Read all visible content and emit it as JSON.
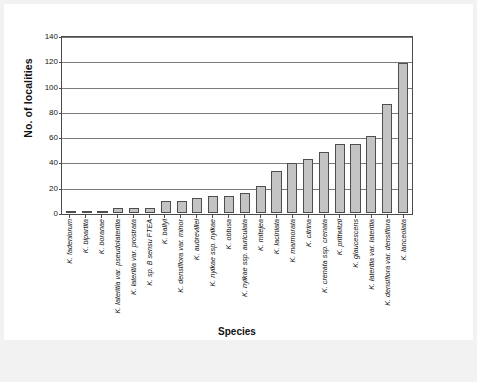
{
  "chart_data": {
    "type": "bar",
    "title": "",
    "xlabel": "Species",
    "ylabel": "No. of localities",
    "ylim": [
      0,
      140
    ],
    "ytick_values": [
      0,
      20,
      40,
      60,
      80,
      100,
      120,
      140
    ],
    "ytick_labels": [
      "0",
      "20",
      "40",
      "60",
      "80",
      "100",
      "120",
      "140"
    ],
    "grid": true,
    "legend": "none",
    "bar_fill_color": "#c3c3c3",
    "bar_edge_color": "#4e4e4e",
    "categories": [
      "K. fadeniorum",
      "K. bipartita",
      "K. boranae",
      "K. lateritia var. pseudolateritia",
      "K. lateritia var. prostrata",
      "K. sp. B sensu FTEA",
      "K. ballyi",
      "K. densiflora var. minor",
      "K. aubrevillei",
      "K. nyikae ssp. nyikae",
      "K. obtusa",
      "K. nyikae ssp. auriculata",
      "K. mitejea",
      "K. laciniata",
      "K. marmorata",
      "K. citrina",
      "K. crenata ssp. crenata",
      "K. prittwitzii",
      "K. glaucescens",
      "K. lateritia var. lateritia",
      "K. densiflora var. densiflora",
      "K. lanceolata"
    ],
    "values": [
      1,
      1,
      1,
      4,
      4,
      4,
      10,
      10,
      12,
      14,
      14,
      16,
      22,
      34,
      40,
      43,
      49,
      55,
      55,
      62,
      87,
      120
    ]
  }
}
